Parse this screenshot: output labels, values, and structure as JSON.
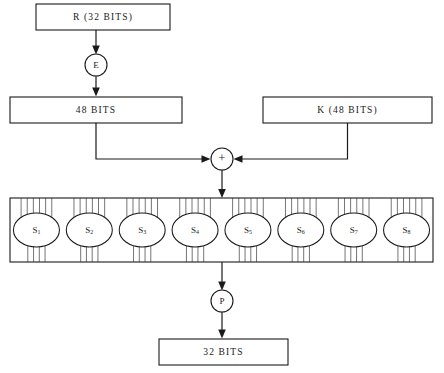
{
  "diagram": {
    "type": "flow-diagram",
    "background_color": "#ffffff",
    "line_color": "#1a1a1a",
    "nodes": {
      "input_box": {
        "label": "R  (32 BITS)",
        "x": 36,
        "y": 4,
        "width": 134,
        "height": 26
      },
      "expansion_circle": {
        "label": "E",
        "cx": 96,
        "cy": 65,
        "r": 11
      },
      "expanded_box": {
        "label": "48  BITS",
        "x": 10,
        "y": 97,
        "width": 172,
        "height": 26
      },
      "key_box": {
        "label": "K  (48 BITS)",
        "x": 263,
        "y": 97,
        "width": 169,
        "height": 26
      },
      "xor_circle": {
        "label": "+",
        "cx": 222,
        "cy": 159,
        "r": 11
      },
      "permutation_circle": {
        "label": "P",
        "cx": 222,
        "cy": 301,
        "r": 11
      },
      "output_box": {
        "label": "32  BITS",
        "x": 159,
        "y": 339,
        "width": 129,
        "height": 26
      }
    },
    "sbox_panel": {
      "x": 10,
      "y": 198,
      "width": 423,
      "height": 64,
      "count": 8,
      "inputs_per_box": 6,
      "outputs_per_box": 4,
      "ellipse_width": 46,
      "ellipse_height": 34,
      "boxes": [
        {
          "name": "S",
          "subscript": "1"
        },
        {
          "name": "S",
          "subscript": "2"
        },
        {
          "name": "S",
          "subscript": "3"
        },
        {
          "name": "S",
          "subscript": "4"
        },
        {
          "name": "S",
          "subscript": "5"
        },
        {
          "name": "S",
          "subscript": "6"
        },
        {
          "name": "S",
          "subscript": "7"
        },
        {
          "name": "S",
          "subscript": "8"
        }
      ]
    },
    "connections": [
      {
        "from": "input_box",
        "to": "expansion_circle",
        "arrow": true
      },
      {
        "from": "expansion_circle",
        "to": "expanded_box",
        "arrow": true
      },
      {
        "from": "expanded_box",
        "to": "xor_circle",
        "arrow": true,
        "route": "elbow-right"
      },
      {
        "from": "key_box",
        "to": "xor_circle",
        "arrow": true,
        "route": "elbow-left"
      },
      {
        "from": "xor_circle",
        "to": "sbox_panel",
        "arrow": true
      },
      {
        "from": "sbox_panel",
        "to": "permutation_circle",
        "arrow": true
      },
      {
        "from": "permutation_circle",
        "to": "output_box",
        "arrow": true
      }
    ]
  }
}
